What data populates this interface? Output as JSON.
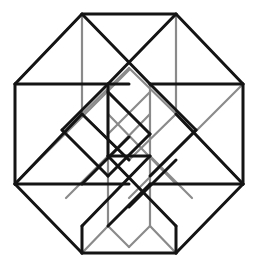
{
  "figure": {
    "name": "tesseract-projection",
    "width": 258,
    "height": 268,
    "background_color": "#ffffff"
  },
  "style": {
    "dark_color": "#141414",
    "light_color": "#8a8a8a",
    "dark_width": 3.0,
    "light_width": 2.2
  },
  "geometry": {
    "outer_left_x": 15,
    "outer_right_x": 243,
    "outer_top_y": 14,
    "outer_bottom_y": 253,
    "band_top_y": 84,
    "band_bottom_y": 184,
    "corner_left_x": 82,
    "corner_right_x": 176,
    "inner_left_x": 108,
    "inner_right_x": 150,
    "inner_top_y": 84,
    "inner_bottom_y": 156,
    "mid_x": 129,
    "mid_y": 134
  },
  "edges": {
    "dark": [
      [
        82,
        14,
        176,
        14
      ],
      [
        82,
        14,
        15,
        84
      ],
      [
        176,
        14,
        243,
        84
      ],
      [
        15,
        84,
        15,
        184
      ],
      [
        243,
        84,
        243,
        184
      ],
      [
        15,
        184,
        82,
        253
      ],
      [
        243,
        184,
        176,
        253
      ],
      [
        82,
        253,
        176,
        253
      ],
      [
        15,
        84,
        129,
        84
      ],
      [
        150,
        84,
        243,
        84
      ],
      [
        15,
        184,
        129,
        184
      ],
      [
        150,
        184,
        243,
        184
      ],
      [
        108,
        84,
        108,
        156
      ],
      [
        108,
        156,
        150,
        156
      ],
      [
        82,
        14,
        150,
        84
      ],
      [
        176,
        14,
        108,
        84
      ],
      [
        15,
        184,
        82,
        114
      ],
      [
        82,
        114,
        129,
        160
      ],
      [
        108,
        84,
        62,
        130
      ],
      [
        62,
        130,
        108,
        176
      ],
      [
        108,
        176,
        150,
        134
      ],
      [
        150,
        134,
        108,
        92
      ],
      [
        150,
        84,
        196,
        130
      ],
      [
        196,
        130,
        150,
        176
      ],
      [
        243,
        184,
        176,
        114
      ],
      [
        108,
        156,
        176,
        226
      ],
      [
        150,
        156,
        82,
        226
      ],
      [
        82,
        226,
        82,
        253
      ],
      [
        176,
        226,
        176,
        253
      ],
      [
        82,
        184,
        129,
        137
      ],
      [
        150,
        184,
        108,
        226
      ],
      [
        129,
        207,
        176,
        160
      ]
    ],
    "light": [
      [
        82,
        14,
        82,
        114
      ],
      [
        176,
        14,
        176,
        114
      ],
      [
        82,
        114,
        15,
        184
      ],
      [
        176,
        114,
        243,
        184
      ],
      [
        82,
        114,
        129,
        68
      ],
      [
        176,
        114,
        129,
        68
      ],
      [
        108,
        84,
        108,
        226
      ],
      [
        150,
        84,
        150,
        226
      ],
      [
        108,
        226,
        82,
        253
      ],
      [
        150,
        226,
        176,
        253
      ],
      [
        108,
        226,
        129,
        247
      ],
      [
        150,
        226,
        129,
        247
      ],
      [
        15,
        84,
        82,
        14
      ],
      [
        15,
        184,
        129,
        70
      ],
      [
        129,
        198,
        243,
        84
      ],
      [
        108,
        156,
        66,
        198
      ],
      [
        150,
        156,
        192,
        198
      ],
      [
        82,
        114,
        129,
        160
      ],
      [
        176,
        114,
        129,
        160
      ],
      [
        108,
        92,
        150,
        134
      ],
      [
        150,
        92,
        108,
        134
      ],
      [
        82,
        184,
        150,
        114
      ],
      [
        176,
        184,
        108,
        114
      ]
    ]
  }
}
